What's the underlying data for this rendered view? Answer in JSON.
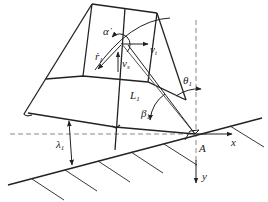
{
  "diagram": {
    "labels": {
      "alpha_dot": "α̇",
      "r_dot": "ṙ",
      "r_sub": "1",
      "v_t": "v",
      "v_t_sub": "t",
      "v_s": "v",
      "v_s_sub": "s",
      "L": "L",
      "L_sub": "1",
      "theta": "θ",
      "theta_sub": "1",
      "beta": "β",
      "beta_sub": "1",
      "lambda": "λ",
      "lambda_sub": "1",
      "point_A": "A",
      "axis_x": "x",
      "axis_y": "y"
    },
    "colors": {
      "stroke": "#222222",
      "dashed": "#888888",
      "background": "#ffffff"
    }
  }
}
